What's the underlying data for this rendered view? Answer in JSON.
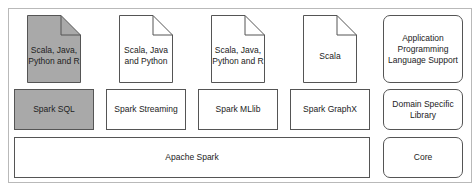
{
  "diagram": {
    "languages": [
      {
        "text_line1": "Scala, Java,",
        "text_line2": "Python and R",
        "highlighted": true
      },
      {
        "text_line1": "Scala, Java",
        "text_line2": "and Python",
        "highlighted": false
      },
      {
        "text_line1": "Scala, Java,",
        "text_line2": "Python and R",
        "highlighted": false
      },
      {
        "text_line1": "Scala",
        "text_line2": "",
        "highlighted": false
      }
    ],
    "libraries": [
      {
        "label": "Spark SQL",
        "highlighted": true
      },
      {
        "label": "Spark Streaming",
        "highlighted": false
      },
      {
        "label": "Spark MLlib",
        "highlighted": false
      },
      {
        "label": "Spark GraphX",
        "highlighted": false
      }
    ],
    "core": {
      "label": "Apache Spark"
    },
    "legend": {
      "api": {
        "line1": "Application",
        "line2": "Programming",
        "line3": "Language Support"
      },
      "domain": {
        "line1": "Domain Specific",
        "line2": "Library"
      },
      "core": {
        "label": "Core"
      }
    },
    "colors": {
      "highlight": "#a9a9a9",
      "border": "#555555",
      "frame": "#b9b9b9"
    }
  }
}
